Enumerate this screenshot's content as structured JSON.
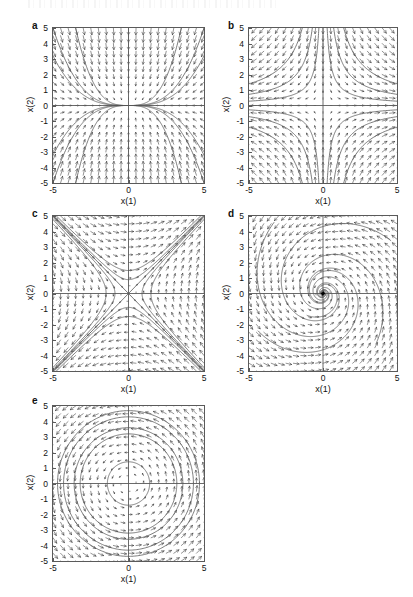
{
  "figure": {
    "title": "",
    "panel_count": 5,
    "axis_x_label": "x(1)",
    "axis_y_label": "x(2)",
    "x_ticks": [
      "-5",
      "0",
      "5"
    ],
    "y_ticks": [
      "5",
      "4",
      "3",
      "2",
      "1",
      "0",
      "-1",
      "-2",
      "-3",
      "-4",
      "-5"
    ],
    "xlim": [
      -5,
      5
    ],
    "ylim": [
      -5,
      5
    ],
    "line_color": "#5a5a5a",
    "arrow_color": "#3a3a3a",
    "axis_color": "#5a5a5a"
  },
  "chart_data": {
    "type": "scatter",
    "title": "",
    "xlabel": "x(1)",
    "ylabel": "x(2)",
    "xlim": [
      -5,
      5
    ],
    "ylim": [
      -5,
      5
    ],
    "grid": false,
    "legend": "none",
    "panels": [
      {
        "label": "a",
        "kind": "stable-node",
        "xlabel": "x(1)",
        "ylabel": "x(2)",
        "xlim": [
          -5,
          5
        ],
        "ylim": [
          -5,
          5
        ],
        "x_ticks": [
          "-5",
          "0",
          "5"
        ],
        "y_ticks": [
          "5",
          "4",
          "3",
          "2",
          "1",
          "0",
          "-1",
          "-2",
          "-3",
          "-4",
          "-5"
        ],
        "field": {
          "a11": -1,
          "a12": 0,
          "a21": 0,
          "a22": -3
        },
        "grid_n": 21,
        "trajectories_note": "curves approach origin tangent to the slow eigendirection (horizontal)"
      },
      {
        "label": "b",
        "kind": "saddle",
        "xlabel": "x(1)",
        "ylabel": "x(2)",
        "xlim": [
          -5,
          5
        ],
        "ylim": [
          -5,
          5
        ],
        "x_ticks": [
          "-5",
          "0",
          "5"
        ],
        "y_ticks": [
          "5",
          "4",
          "3",
          "2",
          "1",
          "0",
          "-1",
          "-2",
          "-3",
          "-4",
          "-5"
        ],
        "field": {
          "a11": 1,
          "a12": 0,
          "a21": 0,
          "a22": -1
        },
        "grid_n": 21,
        "trajectories_note": "hyperbolic branches xy = const in each quadrant"
      },
      {
        "label": "c",
        "kind": "saddle-rotated",
        "xlabel": "x(1)",
        "ylabel": "x(2)",
        "xlim": [
          -5,
          5
        ],
        "ylim": [
          -5,
          5
        ],
        "x_ticks": [
          "-5",
          "0",
          "5"
        ],
        "y_ticks": [
          "5",
          "4",
          "3",
          "2",
          "1",
          "0",
          "-1",
          "-2",
          "-3",
          "-4",
          "-5"
        ],
        "field": {
          "a11": 0,
          "a12": 1,
          "a21": 1,
          "a22": 0
        },
        "grid_n": 21,
        "trajectories_note": "two straight eigenvector lines along y = x and y = -x plus curved orbits"
      },
      {
        "label": "d",
        "kind": "stable-spiral",
        "xlabel": "x(1)",
        "ylabel": "x(2)",
        "xlim": [
          -5,
          5
        ],
        "ylim": [
          -5,
          5
        ],
        "x_ticks": [
          "-5",
          "0",
          "5"
        ],
        "y_ticks": [
          "5",
          "4",
          "3",
          "2",
          "1",
          "0",
          "-1",
          "-2",
          "-3",
          "-4",
          "-5"
        ],
        "field": {
          "a11": -0.3,
          "a12": -1,
          "a21": 1,
          "a22": -0.3
        },
        "grid_n": 21,
        "trajectories_note": "spirals winding counter-clockwise into the origin"
      },
      {
        "label": "e",
        "kind": "center",
        "xlabel": "x(1)",
        "ylabel": "x(2)",
        "xlim": [
          -5,
          5
        ],
        "ylim": [
          -5,
          5
        ],
        "x_ticks": [
          "-5",
          "0",
          "5"
        ],
        "y_ticks": [
          "5",
          "4",
          "3",
          "2",
          "1",
          "0",
          "-1",
          "-2",
          "-3",
          "-4",
          "-5"
        ],
        "field": {
          "a11": 0,
          "a12": -1,
          "a21": 1,
          "a22": 0
        },
        "grid_n": 21,
        "closed_orbit_radii": [
          1.4,
          3.2,
          3.6,
          4.3,
          4.7
        ],
        "trajectories_note": "nested closed circular orbits about the origin"
      }
    ]
  }
}
